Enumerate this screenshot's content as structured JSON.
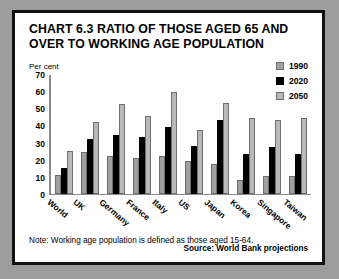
{
  "figure": {
    "title": "CHART 6.3 RATIO OF THOSE AGED 65 AND OVER TO WORKING AGE POPULATION",
    "note": "Note: Working age population is defined as those aged 15-64.",
    "source": "Source: World Bank projections"
  },
  "chart_data": {
    "type": "bar",
    "title": "CHART 6.3 RATIO OF THOSE AGED 65 AND OVER TO WORKING AGE POPULATION",
    "xlabel": "",
    "ylabel": "Per cent",
    "ylim": [
      0,
      70
    ],
    "yticks": [
      0,
      10,
      20,
      30,
      40,
      50,
      60,
      70
    ],
    "grid": false,
    "legend_position": "top-right",
    "categories": [
      "World",
      "UK",
      "Germany",
      "France",
      "Italy",
      "US",
      "Japan",
      "Korea",
      "Singapore",
      "Taiwan"
    ],
    "series": [
      {
        "name": "1990",
        "color": "#a0a0a0",
        "values": [
          11,
          24,
          22,
          21,
          22,
          19,
          17,
          8,
          10,
          10
        ]
      },
      {
        "name": "2020",
        "color": "#000000",
        "values": [
          15,
          32,
          34,
          33,
          39,
          28,
          43,
          23,
          27,
          23
        ]
      },
      {
        "name": "2050",
        "color": "#b9b9b9",
        "values": [
          25,
          42,
          52,
          45,
          59,
          37,
          53,
          44,
          43,
          44
        ]
      }
    ]
  }
}
